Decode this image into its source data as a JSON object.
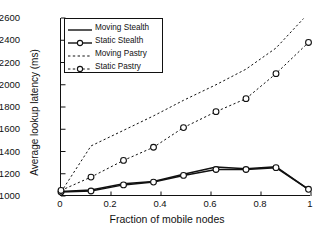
{
  "chart_data": {
    "type": "line",
    "title": "",
    "xlabel": "Fraction of mobile nodes",
    "ylabel": "Average lookup latency (ms)",
    "xlim": [
      0,
      1
    ],
    "ylim": [
      1000,
      2600
    ],
    "xticks": [
      0,
      0.2,
      0.4,
      0.6,
      0.8,
      1
    ],
    "xticklabels": [
      "0",
      "0.2",
      "0.4",
      "0.6",
      "0.8",
      "1"
    ],
    "yticks": [
      1000,
      1200,
      1400,
      1600,
      1800,
      2000,
      2200,
      2400,
      2600
    ],
    "yticklabels": [
      "1000",
      "1200",
      "1400",
      "1600",
      "1800",
      "2000",
      "2200",
      "2400",
      "2600"
    ],
    "grid": false,
    "legend_position": "upper left",
    "series": [
      {
        "name": "Moving Stealth",
        "style": "solid",
        "marker": "none",
        "color": "#111111",
        "x": [
          0,
          0.12,
          0.25,
          0.37,
          0.49,
          0.62,
          0.74,
          0.86,
          0.99
        ],
        "y": [
          1040,
          1055,
          1110,
          1130,
          1195,
          1260,
          1245,
          1262,
          1060
        ]
      },
      {
        "name": "Static Stealth",
        "style": "solid",
        "marker": "circle",
        "color": "#111111",
        "x": [
          0,
          0.12,
          0.25,
          0.37,
          0.49,
          0.62,
          0.74,
          0.86,
          0.99
        ],
        "y": [
          1035,
          1045,
          1100,
          1125,
          1185,
          1238,
          1238,
          1255,
          1060
        ]
      },
      {
        "name": "Moving Pastry",
        "style": "dotted",
        "marker": "none",
        "color": "#111111",
        "x": [
          0,
          0.12,
          0.25,
          0.37,
          0.49,
          0.62,
          0.74,
          0.86,
          0.97
        ],
        "y": [
          1035,
          1450,
          1590,
          1720,
          1860,
          2000,
          2140,
          2330,
          2595
        ]
      },
      {
        "name": "Static Pastry",
        "style": "dotted",
        "marker": "circle",
        "color": "#111111",
        "x": [
          0,
          0.12,
          0.25,
          0.37,
          0.49,
          0.62,
          0.74,
          0.86,
          0.99
        ],
        "y": [
          1050,
          1170,
          1320,
          1438,
          1615,
          1758,
          1875,
          2100,
          2380
        ]
      }
    ]
  },
  "legend": {
    "items": [
      {
        "label": "Moving Stealth"
      },
      {
        "label": "Static Stealth"
      },
      {
        "label": "Moving Pastry"
      },
      {
        "label": "Static Pastry"
      }
    ]
  }
}
